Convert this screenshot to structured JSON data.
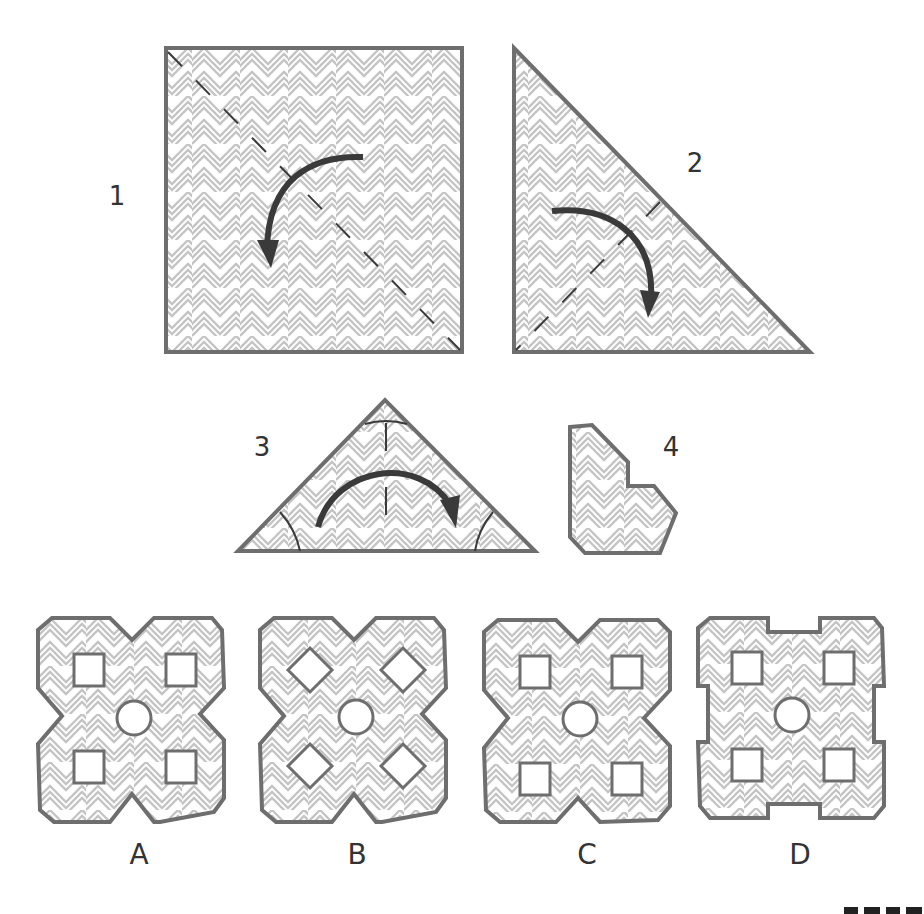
{
  "puzzle": {
    "type": "paper-folding-cutting",
    "steps": [
      {
        "label": "1",
        "shape": "square",
        "fold": "diagonal dashed line, top-right folds onto bottom-left",
        "arrow": "curved, counter-clockwise down-left"
      },
      {
        "label": "2",
        "shape": "right triangle",
        "fold": "dashed line from hypotenuse midpoint to right-angle corner",
        "arrow": "curved, clockwise down"
      },
      {
        "label": "3",
        "shape": "isosceles triangle",
        "fold": "center vertical line",
        "arrow": "curved, left-to-right over the top",
        "cuts": [
          "top corner arc",
          "bottom-left corner arc",
          "bottom-right corner arc"
        ]
      },
      {
        "label": "4",
        "shape": "folded piece with notches (result after cutting)"
      }
    ],
    "options": [
      {
        "label": "A",
        "holes": "4 squares + center circle",
        "outline": "X-shape with V notches on each side, clipped corners"
      },
      {
        "label": "B",
        "holes": "4 diamonds + center circle",
        "outline": "X-shape with V notches on each side, clipped corners"
      },
      {
        "label": "C",
        "holes": "4 squares + center circle",
        "outline": "X-shape with V notches on each side, clipped corners"
      },
      {
        "label": "D",
        "holes": "4 squares + center circle",
        "outline": "rectangular notches on each side, clipped corners"
      }
    ]
  },
  "labels": {
    "step1": "1",
    "step2": "2",
    "step3": "3",
    "step4": "4",
    "optA": "A",
    "optB": "B",
    "optC": "C",
    "optD": "D"
  },
  "colors": {
    "outline": "#6e6e6e",
    "pattern_line": "#c4c4c4",
    "fill": "#ffffff",
    "arrow": "#3a3a3a",
    "fold_line": "#3a3a3a",
    "text": "#333333"
  }
}
